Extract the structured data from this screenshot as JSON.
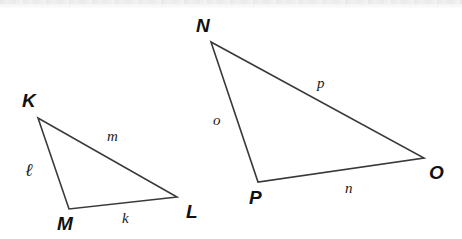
{
  "figure": {
    "background_color": "#ffffff",
    "stroke_color": "#3a3a3a",
    "label_color": "#111111",
    "width": 462,
    "height": 239
  },
  "triangles": [
    {
      "id": "triangle-kml",
      "name": "Triangle KML",
      "vertices": [
        {
          "label": "K",
          "x": 38,
          "y": 118,
          "label_x": 22,
          "label_y": 91
        },
        {
          "label": "M",
          "x": 69,
          "y": 209,
          "label_x": 57,
          "label_y": 214
        },
        {
          "label": "L",
          "x": 177,
          "y": 197,
          "label_x": 186,
          "label_y": 202
        }
      ],
      "sides": [
        {
          "label": "ℓ",
          "name": "side-ell",
          "from": "K",
          "to": "M",
          "label_x": 25,
          "label_y": 161,
          "script": true
        },
        {
          "label": "m",
          "name": "side-m",
          "from": "K",
          "to": "L",
          "label_x": 107,
          "label_y": 129,
          "script": false
        },
        {
          "label": "k",
          "name": "side-k",
          "from": "M",
          "to": "L",
          "label_x": 122,
          "label_y": 211,
          "script": false
        }
      ]
    },
    {
      "id": "triangle-npo",
      "name": "Triangle NPO",
      "vertices": [
        {
          "label": "N",
          "x": 211,
          "y": 42,
          "label_x": 196,
          "label_y": 16
        },
        {
          "label": "P",
          "x": 258,
          "y": 182,
          "label_x": 249,
          "label_y": 188
        },
        {
          "label": "O",
          "x": 424,
          "y": 158,
          "label_x": 429,
          "label_y": 163
        }
      ],
      "sides": [
        {
          "label": "o",
          "name": "side-o",
          "from": "N",
          "to": "P",
          "label_x": 213,
          "label_y": 113,
          "script": false
        },
        {
          "label": "p",
          "name": "side-p",
          "from": "N",
          "to": "O",
          "label_x": 317,
          "label_y": 76,
          "script": false
        },
        {
          "label": "n",
          "name": "side-n",
          "from": "P",
          "to": "O",
          "label_x": 345,
          "label_y": 181,
          "script": false
        }
      ]
    }
  ]
}
